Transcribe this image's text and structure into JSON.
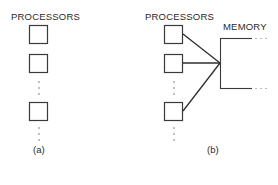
{
  "diagram": {
    "panel_a": {
      "title": "PROCESSORS",
      "caption": "(a)",
      "processor_count_shown": 3,
      "ellipsis": "⋮"
    },
    "panel_b": {
      "title": "PROCESSORS",
      "memory_label": "MEMORY",
      "caption": "(b)",
      "processor_count_shown": 3,
      "memory_bus_ellipsis": "· · ·"
    },
    "colors": {
      "stroke": "#3a3a3a",
      "text": "#2a2a2a",
      "background": "#ffffff"
    }
  }
}
